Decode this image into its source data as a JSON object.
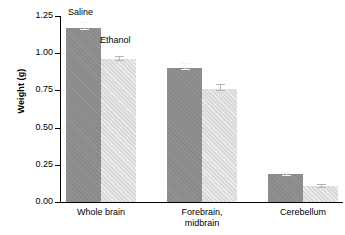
{
  "chart_data": {
    "type": "bar",
    "title": "",
    "xlabel": "",
    "ylabel": "Weight (g)",
    "ylim": [
      0.0,
      1.25
    ],
    "yticks": [
      "0.00",
      "0.25",
      "0.50",
      "0.75",
      "1.00",
      "1.25"
    ],
    "ytick_values": [
      0.0,
      0.25,
      0.5,
      0.75,
      1.0,
      1.25
    ],
    "grid": false,
    "legend_position": "inline-annotation",
    "categories": [
      "Whole brain",
      "Forebrain,\nmidbrain",
      "Cerebellum"
    ],
    "series": [
      {
        "name": "Saline",
        "color": "#8e8e8e",
        "values": [
          1.17,
          0.9,
          0.19
        ],
        "errors": [
          0.025,
          0.025,
          0.007
        ]
      },
      {
        "name": "Ethanol",
        "color": "#dcdcdc",
        "values": [
          0.96,
          0.76,
          0.11
        ],
        "errors": [
          0.018,
          0.022,
          0.006
        ]
      }
    ],
    "annotations": [
      {
        "text": "Saline",
        "series": "Saline"
      },
      {
        "text": "Ethanol",
        "series": "Ethanol"
      }
    ]
  },
  "axis": {
    "y_title": "Weight (g)"
  },
  "colors": {
    "saline": "#8e8e8e",
    "ethanol": "#dcdcdc",
    "axis": "#000000",
    "background": "#ffffff",
    "errorbar_light": "#f2f2f2",
    "errorbar_dark": "#b4b4b4"
  }
}
